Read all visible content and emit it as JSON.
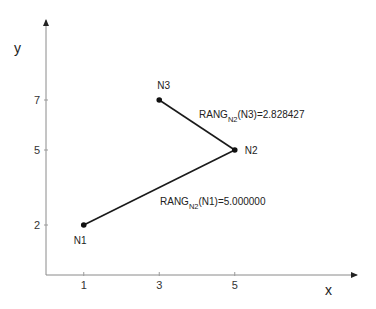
{
  "diagram": {
    "axes": {
      "x_label": "x",
      "y_label": "y",
      "x_ticks": [
        1,
        3,
        5
      ],
      "y_ticks": [
        2,
        5,
        7
      ]
    },
    "nodes": [
      {
        "id": "N1",
        "label": "N1",
        "x": 1,
        "y": 2
      },
      {
        "id": "N2",
        "label": "N2",
        "x": 5,
        "y": 5
      },
      {
        "id": "N3",
        "label": "N3",
        "x": 3,
        "y": 7
      }
    ],
    "edges": [
      {
        "from": "N1",
        "to": "N2"
      },
      {
        "from": "N3",
        "to": "N2"
      }
    ],
    "annotations": [
      {
        "id": "rang-n3",
        "prefix": "RANG",
        "subscript": "N2",
        "suffix": "(N3)=2.828427"
      },
      {
        "id": "rang-n1",
        "prefix": "RANG",
        "subscript": "N2",
        "suffix": "(N1)=5.000000"
      }
    ],
    "colors": {
      "axis": "#8a8a8a",
      "edge": "#1a1a1a",
      "node": "#111111"
    }
  }
}
